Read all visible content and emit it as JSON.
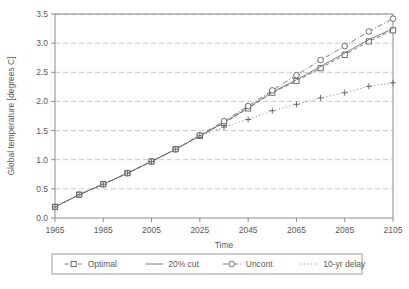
{
  "chart_data": {
    "type": "line",
    "title": "",
    "xlabel": "Time",
    "ylabel": "Global temperature [degrees C]",
    "xlim": [
      1965,
      2105
    ],
    "ylim": [
      0.0,
      3.5
    ],
    "xticks": [
      1965,
      1985,
      2005,
      2025,
      2045,
      2065,
      2085,
      2105
    ],
    "yticks": [
      "0.0",
      "0.5",
      "1.0",
      "1.5",
      "2.0",
      "2.5",
      "3.0",
      "3.5"
    ],
    "grid": "horizontal-dashed",
    "legend_position": "bottom",
    "x": [
      1965,
      1975,
      1985,
      1995,
      2005,
      2015,
      2025,
      2035,
      2045,
      2055,
      2065,
      2075,
      2085,
      2095,
      2105
    ],
    "series": [
      {
        "name": "Optimal",
        "marker": "open-square",
        "linestyle": "dashed",
        "values": [
          0.19,
          0.4,
          0.58,
          0.77,
          0.97,
          1.18,
          1.41,
          1.63,
          1.88,
          2.15,
          2.35,
          2.57,
          2.8,
          3.03,
          3.22
        ]
      },
      {
        "name": "20% cut",
        "marker": "none",
        "linestyle": "solid",
        "values": [
          0.19,
          0.4,
          0.58,
          0.77,
          0.97,
          1.18,
          1.41,
          1.64,
          1.89,
          2.16,
          2.37,
          2.6,
          2.83,
          3.06,
          3.25
        ]
      },
      {
        "name": "Uncont",
        "marker": "open-circle",
        "linestyle": "dash-dot",
        "values": [
          0.19,
          0.4,
          0.58,
          0.77,
          0.97,
          1.18,
          1.42,
          1.66,
          1.92,
          2.19,
          2.45,
          2.71,
          2.95,
          3.2,
          3.42
        ]
      },
      {
        "name": "10-yr delay",
        "marker": "plus",
        "linestyle": "dotted",
        "values": [
          0.19,
          0.4,
          0.58,
          0.77,
          0.97,
          1.18,
          1.41,
          1.56,
          1.69,
          1.84,
          1.95,
          2.06,
          2.15,
          2.26,
          2.32
        ]
      }
    ]
  },
  "legend": {
    "entries": [
      {
        "label": "Optimal"
      },
      {
        "label": "20% cut"
      },
      {
        "label": "Uncont"
      },
      {
        "label": "10-yr delay"
      }
    ]
  }
}
